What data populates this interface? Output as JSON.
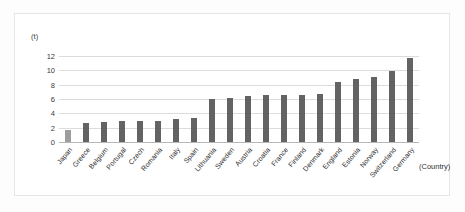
{
  "chart": {
    "unit_label": "(t)",
    "xaxis_title": "(Country)"
  },
  "chart_data": {
    "type": "bar",
    "title": "",
    "subtitle": "",
    "xlabel": "(Country)",
    "ylabel": "(t)",
    "ylim": [
      0,
      12
    ],
    "ytick_values": [
      0,
      2,
      4,
      6,
      8,
      10,
      12
    ],
    "ytick_labels": [
      "0",
      "2",
      "4",
      "6",
      "8",
      "10",
      "12"
    ],
    "grid": true,
    "legend": false,
    "legend_position": "none",
    "bar_color": "#636363",
    "highlight_color": "#9d9d9d",
    "highlight_category": "Japan",
    "categories": [
      "Japan",
      "Greece",
      "Belgium",
      "Portugal",
      "Czech",
      "Romania",
      "Italy",
      "Spain",
      "Lithuania",
      "Sweden",
      "Austria",
      "Croatia",
      "France",
      "Finland",
      "Denmark",
      "England",
      "Estonia",
      "Norway",
      "Switzerland",
      "Germany"
    ],
    "values": [
      1.7,
      2.6,
      2.8,
      2.9,
      2.9,
      3.0,
      3.2,
      3.4,
      6.0,
      6.2,
      6.4,
      6.5,
      6.5,
      6.6,
      6.7,
      8.4,
      8.8,
      9.1,
      9.9,
      11.7
    ]
  }
}
